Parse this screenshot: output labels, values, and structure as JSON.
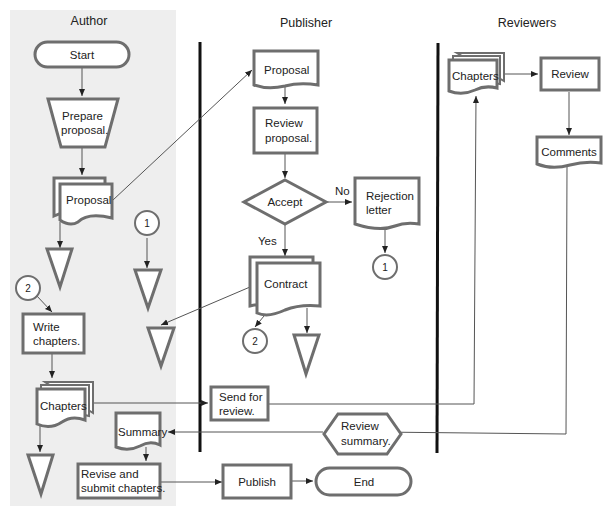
{
  "diagram": {
    "type": "swimlane-flowchart",
    "colors": {
      "author_lane_bg": "#eeeeee",
      "shape_stroke": "#6e6e6e",
      "lane_divider": "#111111",
      "connector": "#555555"
    },
    "lanes": [
      {
        "id": "author",
        "label": "Author"
      },
      {
        "id": "publisher",
        "label": "Publisher"
      },
      {
        "id": "reviewers",
        "label": "Reviewers"
      }
    ],
    "nodes": {
      "start": {
        "label": "Start",
        "shape": "terminator",
        "lane": "author"
      },
      "prepare": {
        "label_lines": [
          "Prepare",
          "proposal."
        ],
        "shape": "manual-operation",
        "lane": "author"
      },
      "proposal_author": {
        "label": "Proposal",
        "shape": "multi-document",
        "lane": "author"
      },
      "connector_1_author": {
        "label": "1",
        "shape": "connector",
        "lane": "author"
      },
      "connector_2_author": {
        "label": "2",
        "shape": "connector",
        "lane": "author"
      },
      "write": {
        "label_lines": [
          "Write",
          "chapters."
        ],
        "shape": "process",
        "lane": "author"
      },
      "chapters_author": {
        "label": "Chapters",
        "shape": "multi-document",
        "lane": "author"
      },
      "summary": {
        "label": "Summary",
        "shape": "document",
        "lane": "author"
      },
      "revise": {
        "label_lines": [
          "Revise and",
          "submit chapters."
        ],
        "shape": "process",
        "lane": "author"
      },
      "proposal_pub": {
        "label": "Proposal",
        "shape": "document",
        "lane": "publisher"
      },
      "review_proposal": {
        "label_lines": [
          "Review",
          "proposal."
        ],
        "shape": "process",
        "lane": "publisher"
      },
      "accept": {
        "label": "Accept",
        "shape": "decision",
        "lane": "publisher"
      },
      "rejection": {
        "label_lines": [
          "Rejection",
          "letter"
        ],
        "shape": "document",
        "lane": "publisher"
      },
      "connector_1_pub": {
        "label": "1",
        "shape": "connector",
        "lane": "publisher"
      },
      "contract": {
        "label": "Contract",
        "shape": "multi-document",
        "lane": "publisher"
      },
      "connector_2_pub": {
        "label": "2",
        "shape": "connector",
        "lane": "publisher"
      },
      "send_review": {
        "label_lines": [
          "Send for",
          "review."
        ],
        "shape": "process",
        "lane": "publisher"
      },
      "review_summary": {
        "label_lines": [
          "Review",
          "summary."
        ],
        "shape": "preparation",
        "lane": "publisher"
      },
      "publish": {
        "label": "Publish",
        "shape": "process",
        "lane": "publisher"
      },
      "end": {
        "label": "End",
        "shape": "terminator",
        "lane": "publisher"
      },
      "chapters_rev": {
        "label": "Chapters",
        "shape": "multi-document",
        "lane": "reviewers"
      },
      "review": {
        "label": "Review",
        "shape": "process",
        "lane": "reviewers"
      },
      "comments": {
        "label": "Comments",
        "shape": "document",
        "lane": "reviewers"
      }
    },
    "edge_labels": {
      "no": "No",
      "yes": "Yes"
    }
  }
}
